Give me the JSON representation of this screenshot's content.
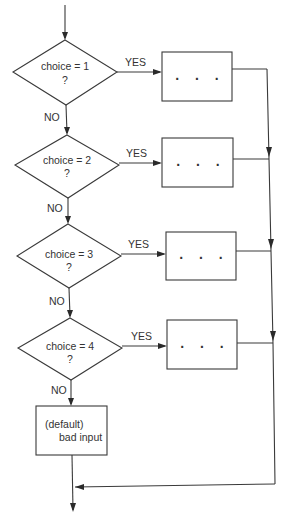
{
  "diagram": {
    "type": "flowchart",
    "decisions": [
      {
        "line1": "choice = 1",
        "line2": "?",
        "yes_label": "YES",
        "no_label": "NO",
        "action": ". . ."
      },
      {
        "line1": "choice = 2",
        "line2": "?",
        "yes_label": "YES",
        "no_label": "NO",
        "action": ". . ."
      },
      {
        "line1": "choice = 3",
        "line2": "?",
        "yes_label": "YES",
        "no_label": "NO",
        "action": ". . ."
      },
      {
        "line1": "choice = 4",
        "line2": "?",
        "yes_label": "YES",
        "no_label": "NO",
        "action": ". . ."
      }
    ],
    "default_box": {
      "line1": "(default)",
      "line2": "bad input"
    },
    "colors": {
      "stroke": "#3a3a3a",
      "text": "#333333",
      "background": "#ffffff"
    }
  }
}
